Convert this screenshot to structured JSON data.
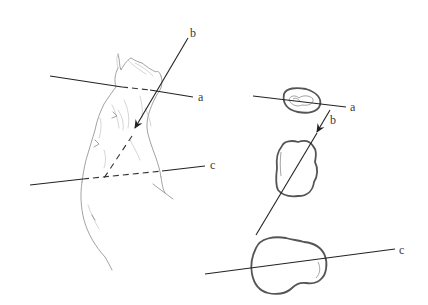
{
  "figure": {
    "type": "anatomical-sectioning-diagram",
    "left_panel": {
      "subject": "sketched limb (arm) with section planes",
      "planes": [
        {
          "id": "a",
          "label": "a",
          "style": "solid with dashed portion behind limb"
        },
        {
          "id": "b",
          "label": "b",
          "style": "arrow, dashed continuation inside limb"
        },
        {
          "id": "c",
          "label": "c",
          "style": "solid with dashed portion behind limb"
        }
      ]
    },
    "right_panel": {
      "subject": "cross-sections of the limb",
      "sections": [
        {
          "id": "a",
          "label": "a",
          "shape": "small oval"
        },
        {
          "id": "b",
          "label": "b",
          "shape": "rounded rectangular blob"
        },
        {
          "id": "c",
          "label": "c",
          "shape": "large bilobed blob"
        }
      ]
    },
    "labels": {
      "left_a": "a",
      "left_b": "b",
      "left_c": "c",
      "right_a": "a",
      "right_b": "b",
      "right_c": "c"
    },
    "colors": {
      "background": "#ffffff",
      "line": "#222222",
      "sketch": "#8a8a8a",
      "section_outline": "#555555"
    }
  }
}
